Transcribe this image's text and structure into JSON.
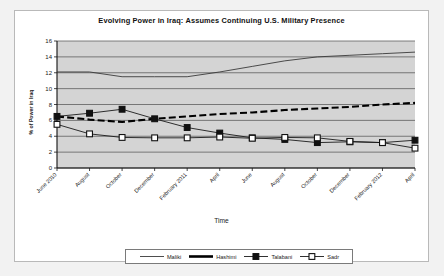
{
  "chart_data": {
    "type": "line",
    "title": "Evolving Power in Iraq: Assumes Continuing U.S. Military Presence",
    "xlabel": "Time",
    "ylabel": "% of Power in Iraq",
    "ylim": [
      0,
      16
    ],
    "yticks": [
      0,
      2,
      4,
      6,
      8,
      10,
      12,
      14,
      16
    ],
    "grid": true,
    "legend_position": "bottom",
    "plot_background": "#d4d4d4",
    "categories": [
      "June 2010",
      "August",
      "October",
      "December",
      "February 2011",
      "April",
      "June",
      "August",
      "October",
      "December",
      "February 2012",
      "April"
    ],
    "series": [
      {
        "name": "Maliki",
        "style": "thin-solid",
        "color": "#3a3a3a",
        "marker": "none",
        "values": [
          12.1,
          12.1,
          11.5,
          11.5,
          11.5,
          12.1,
          12.8,
          13.5,
          14.0,
          14.2,
          14.4,
          14.6
        ]
      },
      {
        "name": "Hashimi",
        "style": "thick-dashed",
        "color": "#000000",
        "marker": "none",
        "values": [
          6.5,
          6.1,
          5.8,
          6.2,
          6.5,
          6.8,
          7.0,
          7.3,
          7.5,
          7.7,
          8.0,
          8.2
        ]
      },
      {
        "name": "Talabani",
        "style": "thin-solid",
        "color": "#1a1a1a",
        "marker": "filled-square",
        "values": [
          6.5,
          6.9,
          7.4,
          6.2,
          5.1,
          4.4,
          3.8,
          3.6,
          3.2,
          3.3,
          3.2,
          3.5
        ]
      },
      {
        "name": "Sadr",
        "style": "thin-solid",
        "color": "#1a1a1a",
        "marker": "open-square",
        "values": [
          5.5,
          4.3,
          3.85,
          3.8,
          3.8,
          3.9,
          3.75,
          3.85,
          3.8,
          3.35,
          3.2,
          2.5
        ]
      }
    ]
  },
  "legend": {
    "items": [
      {
        "label": "Maliki"
      },
      {
        "label": "Hashimi"
      },
      {
        "label": "Talabani"
      },
      {
        "label": "Sadr"
      }
    ]
  }
}
